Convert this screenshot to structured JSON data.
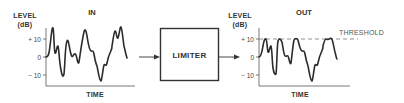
{
  "diagram": {
    "input_plot": {
      "title": "IN",
      "ylabel_line1": "LEVEL",
      "ylabel_line2": "(dB)",
      "xlabel": "TIME",
      "ticks": [
        "+ 10",
        "0",
        "− 10"
      ]
    },
    "block": {
      "label": "LIMITER"
    },
    "output_plot": {
      "title": "OUT",
      "ylabel_line1": "LEVEL",
      "ylabel_line2": "(dB)",
      "xlabel": "TIME",
      "ticks": [
        "+ 10",
        "0",
        "− 10"
      ],
      "threshold_label": "THRESHOLD"
    },
    "colors": {
      "line": "#2b2b2b",
      "axis": "#555555",
      "dashed": "#777777"
    }
  }
}
